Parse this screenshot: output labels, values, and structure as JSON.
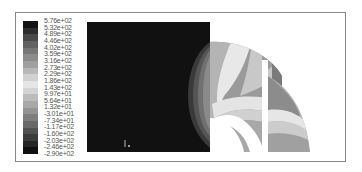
{
  "figure": {
    "type": "contour-plot",
    "background": "#ffffff",
    "frame_color": "#8a8a8a"
  },
  "legend": {
    "labels": [
      "5.76e+02",
      "5.32e+02",
      "4.89e+02",
      "4.46e+02",
      "4.02e+02",
      "3.59e+02",
      "3.16e+02",
      "2.73e+02",
      "2.29e+02",
      "1.86e+02",
      "1.43e+02",
      "9.97e+01",
      "5.64e+01",
      "1.32e+01",
      "-3.01e+01",
      "-7.34e+01",
      "-1.17e+02",
      "-1.60e+02",
      "-2.03e+02",
      "-2.46e+02",
      "-2.90e+02"
    ],
    "band_colors": [
      "#141414",
      "#2e2e2e",
      "#4a4a4a",
      "#626262",
      "#777777",
      "#8c8c8c",
      "#a0a0a0",
      "#b8b8b8",
      "#d0d0d0",
      "#e6e6e6",
      "#d4d4d4",
      "#bcbcbc",
      "#a8a8a8",
      "#949494",
      "#7e7e7e",
      "#686868",
      "#525252",
      "#3c3c3c",
      "#262626",
      "#101010"
    ]
  },
  "axis_triad": {
    "label": "1"
  }
}
